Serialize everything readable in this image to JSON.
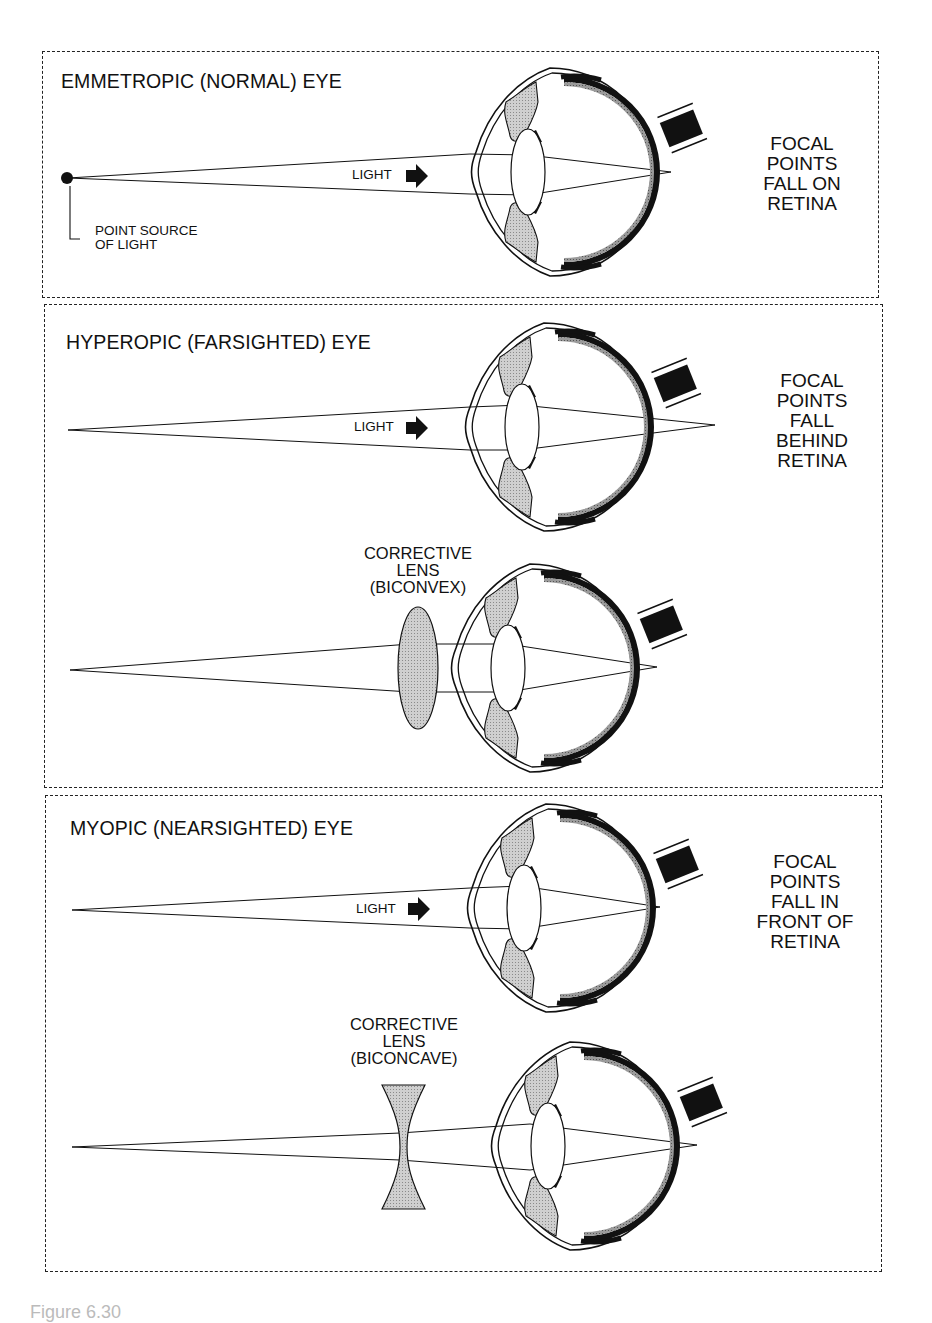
{
  "figure": {
    "caption": "Figure 6.30"
  },
  "panels": [
    {
      "id": "emmetropic",
      "title": "EMMETROPIC (NORMAL) EYE",
      "light_label": "LIGHT",
      "source_label": [
        "POINT SOURCE",
        "OF LIGHT"
      ],
      "result_label": [
        "FOCAL",
        "POINTS",
        "FALL ON",
        "RETINA"
      ]
    },
    {
      "id": "hyperopic",
      "title": "HYPEROPIC (FARSIGHTED) EYE",
      "light_label": "LIGHT",
      "result_label": [
        "FOCAL",
        "POINTS",
        "FALL",
        "BEHIND",
        "RETINA"
      ],
      "lens_label": [
        "CORRECTIVE",
        "LENS",
        "(BICONVEX)"
      ]
    },
    {
      "id": "myopic",
      "title": "MYOPIC (NEARSIGHTED) EYE",
      "light_label": "LIGHT",
      "result_label": [
        "FOCAL",
        "POINTS",
        "FALL IN",
        "FRONT OF",
        "RETINA"
      ],
      "lens_label": [
        "CORRECTIVE",
        "LENS",
        "(BICONCAVE)"
      ]
    }
  ],
  "colors": {
    "ink": "#111111",
    "lens_fill": "#a8a8a8",
    "iris_fill": "#d4d4d4",
    "frame": "#222222",
    "background": "#ffffff"
  }
}
